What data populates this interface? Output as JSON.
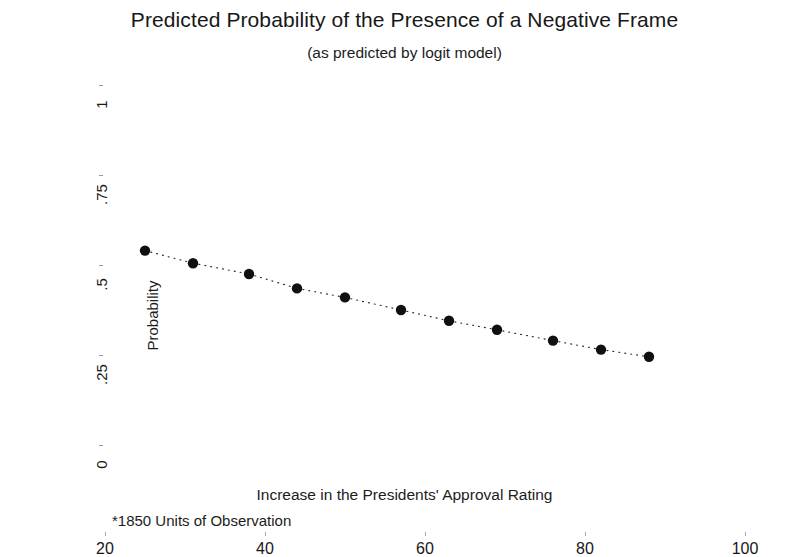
{
  "chart_data": {
    "type": "scatter",
    "title": "Predicted Probability of the Presence of a Negative Frame",
    "subtitle": "(as predicted by logit model)",
    "xlabel": "Increase in the Presidents' Approval Rating",
    "ylabel": "Probability",
    "footnote": "*1850 Units of Observation",
    "xlim": [
      20,
      100
    ],
    "ylim": [
      0,
      1
    ],
    "grid": false,
    "legend": false,
    "legend_position": "none",
    "xticks": [
      20,
      40,
      60,
      80,
      100
    ],
    "xtick_labels": [
      "20",
      "40",
      "60",
      "80",
      "100"
    ],
    "yticks": [
      0,
      0.25,
      0.5,
      0.75,
      1
    ],
    "ytick_labels": [
      "0",
      ".25",
      ".5",
      ".75",
      "1"
    ],
    "marker_style": "filled-circle",
    "line_style": "dotted",
    "x": [
      25,
      31,
      38,
      44,
      50,
      57,
      63,
      69,
      76,
      82,
      88
    ],
    "y": [
      0.54,
      0.505,
      0.475,
      0.435,
      0.41,
      0.375,
      0.345,
      0.32,
      0.29,
      0.265,
      0.245
    ],
    "series": [
      {
        "name": "Predicted probability",
        "x": [
          25,
          31,
          38,
          44,
          50,
          57,
          63,
          69,
          76,
          82,
          88
        ],
        "values": [
          0.54,
          0.505,
          0.475,
          0.435,
          0.41,
          0.375,
          0.345,
          0.32,
          0.29,
          0.265,
          0.245
        ]
      }
    ]
  },
  "colors": {
    "marker": "#101010",
    "line": "#2a2a2a",
    "text": "#1a1a1a",
    "background": "#ffffff",
    "tick": "#9a9a9a"
  }
}
